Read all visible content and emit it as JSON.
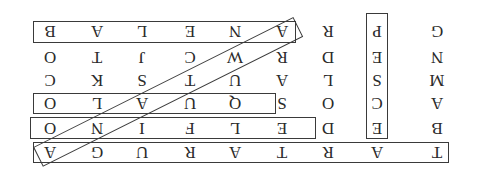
{
  "puzzle": {
    "type": "word-search",
    "orientation": "rotated-180",
    "rows_as_displayed": [
      [
        "B",
        "A",
        "L",
        "E",
        "N",
        "A",
        "R",
        "P",
        "G"
      ],
      [
        "O",
        "T",
        "J",
        "C",
        "W",
        "R",
        "D",
        "E",
        "N"
      ],
      [
        "C",
        "K",
        "S",
        "T",
        "U",
        "A",
        "L",
        "S",
        "M"
      ],
      [
        "O",
        "L",
        "A",
        "U",
        "Q",
        "S",
        "O",
        "C",
        "A"
      ],
      [
        "O",
        "N",
        "I",
        "F",
        "L",
        "E",
        "D",
        "E",
        "B"
      ],
      [
        "A",
        "G",
        "U",
        "R",
        "A",
        "T",
        "R",
        "A",
        "T"
      ]
    ],
    "found_words": [
      "TARTARUGA",
      "DELFINO",
      "SQUALO",
      "BALENA",
      "PESCE",
      "AQUILA-diagonal"
    ]
  }
}
